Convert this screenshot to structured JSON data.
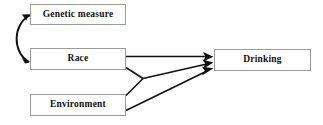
{
  "diagram": {
    "title_text": "",
    "background_color": "#ffffff",
    "line_color": "#111111",
    "box_border_color": "#9a9a9a",
    "nodes": [
      {
        "id": "genetic",
        "label": "Genetic measure"
      },
      {
        "id": "race",
        "label": "Race"
      },
      {
        "id": "environment",
        "label": "Environment"
      },
      {
        "id": "drinking",
        "label": "Drinking"
      }
    ],
    "edges": [
      {
        "id": "genetic-race",
        "from": "genetic",
        "to": "race",
        "style": "curved",
        "arrow": "double"
      },
      {
        "id": "race-drinking-direct",
        "from": "race",
        "to": "drinking",
        "style": "straight",
        "arrow": "single"
      },
      {
        "id": "race-junction",
        "from": "race",
        "to": "junction",
        "style": "straight",
        "arrow": "none"
      },
      {
        "id": "environment-junction",
        "from": "environment",
        "to": "junction",
        "style": "straight",
        "arrow": "none"
      },
      {
        "id": "junction-drinking",
        "from": "junction",
        "to": "drinking",
        "style": "straight",
        "arrow": "single"
      },
      {
        "id": "environment-drinking",
        "from": "environment",
        "to": "drinking",
        "style": "straight",
        "arrow": "single"
      }
    ]
  }
}
